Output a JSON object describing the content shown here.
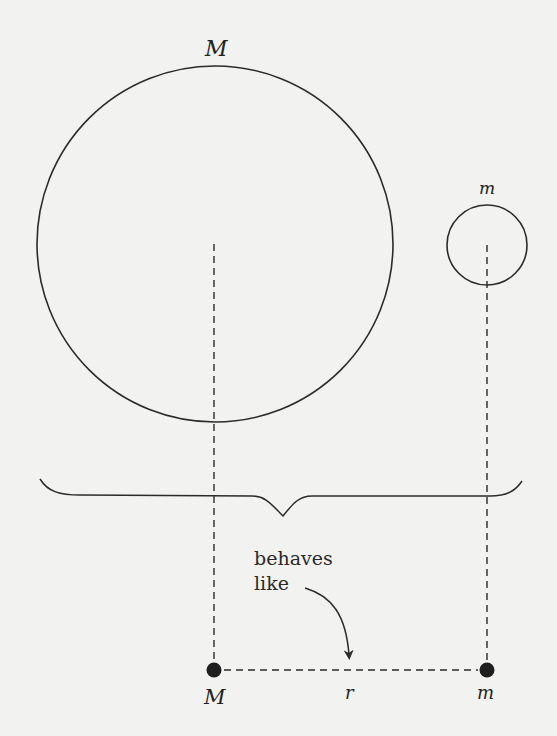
{
  "diagram": {
    "big_body": {
      "label": "M",
      "cx": 215,
      "cy": 244,
      "r": 178
    },
    "small_body": {
      "label": "m",
      "cx": 487,
      "cy": 245,
      "r": 40
    },
    "caption": {
      "line1": "behaves",
      "line2": "like"
    },
    "point_masses": {
      "big": {
        "label": "M",
        "x": 214,
        "y": 670
      },
      "small": {
        "label": "m",
        "x": 487,
        "y": 670
      }
    },
    "separation_label": "r",
    "colors": {
      "stroke": "#2b2b2b",
      "background": "#f2f2f0"
    }
  }
}
